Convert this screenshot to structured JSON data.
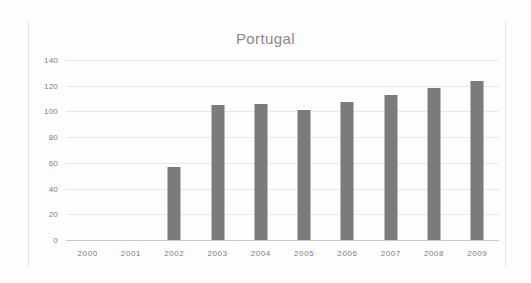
{
  "chart_data": {
    "type": "bar",
    "title": "Portugal",
    "xlabel": "",
    "ylabel": "",
    "categories": [
      "2000",
      "2001",
      "2002",
      "2003",
      "2004",
      "2005",
      "2006",
      "2007",
      "2008",
      "2009"
    ],
    "values": [
      null,
      null,
      57,
      105,
      106,
      101,
      107,
      113,
      118,
      124
    ],
    "ylim": [
      0,
      140
    ],
    "yticks": [
      "0",
      "20",
      "40",
      "60",
      "80",
      "100",
      "120",
      "140"
    ],
    "ytick_values": [
      0,
      20,
      40,
      60,
      80,
      100,
      120,
      140
    ],
    "grid": true,
    "legend": false,
    "series": [
      {
        "name": "Portugal",
        "color": "#7b7b7b",
        "values": [
          null,
          null,
          57,
          105,
          106,
          101,
          107,
          113,
          118,
          124
        ]
      }
    ]
  },
  "colors": {
    "bar": "#7b7b7b",
    "grid": "#e8e8e8",
    "axis": "#c9c9c9",
    "text": "#7d7d7d",
    "title": "#8a8a8a",
    "background": "#fdfdfd"
  }
}
